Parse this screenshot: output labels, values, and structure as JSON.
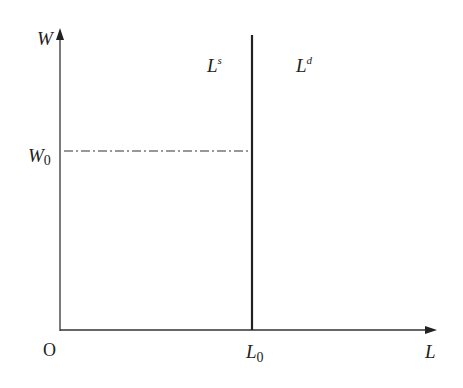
{
  "diagram": {
    "type": "labor-market-supply-demand",
    "axes": {
      "y_label": "W",
      "x_label": "L",
      "origin_label": "O"
    },
    "curves": {
      "supply_label_base": "L",
      "supply_label_sup": "s",
      "demand_label_base": "L",
      "demand_label_sup": "d"
    },
    "markers": {
      "wage_label_base": "W",
      "wage_label_sub": "0",
      "quantity_label_base": "L",
      "quantity_label_sub": "0"
    },
    "colors": {
      "line": "#222222",
      "background": "#ffffff"
    }
  }
}
